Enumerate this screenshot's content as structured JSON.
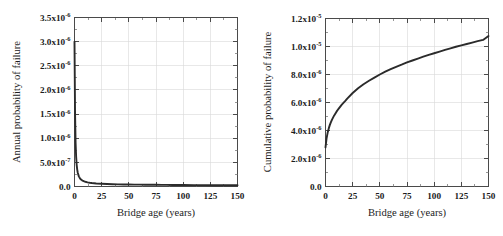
{
  "figure": {
    "background_color": "#ffffff",
    "curve_color": "#2b2b2b",
    "axis_color": "#4a4a4a",
    "grid_color": "#d8d8d8"
  },
  "chart_data": [
    {
      "type": "line",
      "panel": "left",
      "title": "",
      "xlabel": "Bridge age (years)",
      "ylabel": "Annual probability of failure",
      "xlim": [
        0,
        150
      ],
      "ylim": [
        0,
        3.5e-06
      ],
      "grid": true,
      "legend": "none",
      "xticks": [
        0,
        25,
        50,
        75,
        100,
        125,
        150
      ],
      "xticklabels": [
        "0",
        "25",
        "50",
        "75",
        "100",
        "125",
        "150"
      ],
      "yticks": [
        0,
        5e-07,
        1e-06,
        1.5e-06,
        2e-06,
        2.5e-06,
        3e-06,
        3.5e-06
      ],
      "yticklabels_mantissa": [
        "0.0",
        "5.0x10",
        "1.0x10",
        "1.5x10",
        "2.0x10",
        "2.5x10",
        "3.0x10",
        "3.5x10"
      ],
      "yticklabels_exponent": [
        "",
        "-7",
        "-6",
        "-6",
        "-6",
        "-6",
        "-6",
        "-6"
      ],
      "x": [
        0,
        0.5,
        1,
        1.5,
        2,
        2.5,
        3,
        4,
        5,
        6,
        7,
        8,
        9,
        10,
        12,
        14,
        16,
        18,
        20,
        25,
        30,
        35,
        40,
        45,
        50,
        55,
        60,
        65,
        70,
        75,
        80,
        85,
        90,
        95,
        100,
        110,
        120,
        130,
        140,
        150
      ],
      "y": [
        3e-06,
        1.55e-06,
        9e-07,
        6.2e-07,
        4.5e-07,
        3.5e-07,
        2.85e-07,
        2.1e-07,
        1.7e-07,
        1.45e-07,
        1.28e-07,
        1.15e-07,
        1.05e-07,
        9.8e-08,
        8.6e-08,
        7.8e-08,
        7.2e-08,
        6.7e-08,
        6.3e-08,
        5.6e-08,
        5.1e-08,
        4.7e-08,
        4.4e-08,
        4.2e-08,
        4e-08,
        3.9e-08,
        3.8e-08,
        3.7e-08,
        3.6e-08,
        3.5e-08,
        3.4e-08,
        3.3e-08,
        3.2e-08,
        3.1e-08,
        3e-08,
        2.9e-08,
        2.8e-08,
        2.7e-08,
        2.6e-08,
        2.5e-08
      ]
    },
    {
      "type": "line",
      "panel": "right",
      "title": "",
      "xlabel": "Bridge age (years)",
      "ylabel": "Cumulative probability of failure",
      "xlim": [
        0,
        150
      ],
      "ylim": [
        0,
        1.2e-05
      ],
      "grid": true,
      "legend": "none",
      "xticks": [
        0,
        25,
        50,
        75,
        100,
        125,
        150
      ],
      "xticklabels": [
        "0",
        "25",
        "50",
        "75",
        "100",
        "125",
        "150"
      ],
      "yticks": [
        0,
        2e-06,
        4e-06,
        6e-06,
        8e-06,
        1e-05,
        1.2e-05
      ],
      "yticklabels_mantissa": [
        "0.0",
        "2.0x10",
        "4.0x10",
        "6.0x10",
        "8.0x10",
        "1.0x10",
        "1.2x10"
      ],
      "yticklabels_exponent": [
        "",
        "-6",
        "-6",
        "-6",
        "-6",
        "-5",
        "-5"
      ],
      "x": [
        0,
        1,
        2,
        3,
        4,
        5,
        6,
        8,
        10,
        12,
        15,
        18,
        20,
        25,
        30,
        35,
        40,
        45,
        50,
        55,
        60,
        65,
        70,
        75,
        80,
        85,
        90,
        95,
        100,
        105,
        110,
        115,
        120,
        125,
        130,
        135,
        140,
        145,
        150
      ],
      "y": [
        2.8e-06,
        3.45e-06,
        3.85e-06,
        4.15e-06,
        4.4e-06,
        4.6e-06,
        4.78e-06,
        5.08e-06,
        5.33e-06,
        5.55e-06,
        5.85e-06,
        6.1e-06,
        6.28e-06,
        6.68e-06,
        7.02e-06,
        7.3e-06,
        7.55e-06,
        7.78e-06,
        8e-06,
        8.2e-06,
        8.38e-06,
        8.55e-06,
        8.7e-06,
        8.86e-06,
        9e-06,
        9.14e-06,
        9.27e-06,
        9.4e-06,
        9.52e-06,
        9.64e-06,
        9.76e-06,
        9.87e-06,
        9.98e-06,
        1.008e-05,
        1.018e-05,
        1.028e-05,
        1.038e-05,
        1.047e-05,
        1.075e-05
      ]
    }
  ]
}
